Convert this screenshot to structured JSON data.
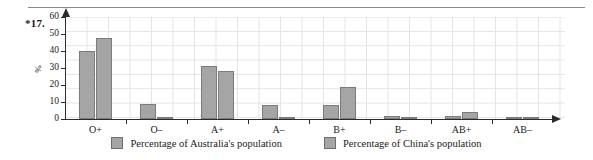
{
  "question_number": "*17.",
  "chart_data": {
    "type": "bar",
    "title": "",
    "xlabel": "",
    "ylabel": "%",
    "ylim": [
      0,
      60
    ],
    "yticks": [
      0,
      10,
      20,
      30,
      40,
      50,
      60
    ],
    "grid": true,
    "legend_position": "bottom",
    "categories": [
      "O+",
      "O–",
      "A+",
      "A–",
      "B+",
      "B–",
      "AB+",
      "AB–"
    ],
    "series": [
      {
        "name": "Percentage of Australia's population",
        "color": "#a5a5a5",
        "values": [
          40,
          9,
          31,
          8,
          8,
          2,
          2,
          0.5
        ]
      },
      {
        "name": "Percentage of China's population",
        "color": "#a5a5a5",
        "values": [
          47.5,
          1,
          28,
          1,
          19,
          0.7,
          4,
          0.3
        ]
      }
    ]
  },
  "legend": {
    "items": [
      {
        "label": "Percentage of Australia's population"
      },
      {
        "label": "Percentage of China's population"
      }
    ]
  }
}
